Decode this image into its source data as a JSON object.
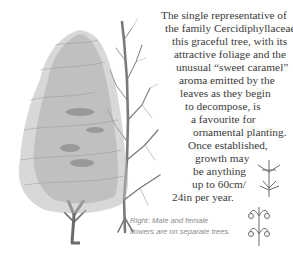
{
  "body_text": {
    "lines": [
      {
        "text": "The single representative of",
        "x": 161,
        "y": 9
      },
      {
        "text": "the family Cercidiphyllaceae,",
        "x": 165,
        "y": 22
      },
      {
        "text": "this graceful tree, with its",
        "x": 172,
        "y": 35
      },
      {
        "text": "attractive foliage and the",
        "x": 174,
        "y": 48
      },
      {
        "text": "unusual “sweet caramel”",
        "x": 176,
        "y": 61
      },
      {
        "text": "aroma emitted by the",
        "x": 179,
        "y": 74
      },
      {
        "text": "leaves as they begin",
        "x": 180,
        "y": 87
      },
      {
        "text": "to decompose, is",
        "x": 185,
        "y": 100
      },
      {
        "text": "a favourite for",
        "x": 191,
        "y": 113
      },
      {
        "text": "ornamental planting.",
        "x": 193,
        "y": 126
      },
      {
        "text": "Once established,",
        "x": 188,
        "y": 139
      },
      {
        "text": "growth may",
        "x": 195,
        "y": 152
      },
      {
        "text": "be anything",
        "x": 193,
        "y": 165
      },
      {
        "text": "up to 60cm/",
        "x": 192,
        "y": 178
      },
      {
        "text": "24in per year.",
        "x": 172,
        "y": 191
      }
    ]
  },
  "caption": {
    "line1": "Right: Male and female",
    "line2": "flowers are on separate trees."
  },
  "illustrations": {
    "left_tree": "foliage-tree-icon",
    "right_tree": "bare-tree-icon",
    "flowers_top": "male-flower-icon",
    "flowers_bottom": "female-flower-icon"
  },
  "colors": {
    "ink": "#3a3a3a",
    "caption": "#8a8a8a",
    "foliage": "#9a9a9a",
    "trunk": "#6e6e6e"
  }
}
